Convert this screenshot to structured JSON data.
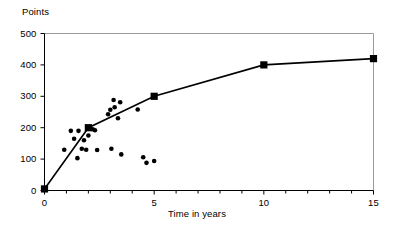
{
  "chart_data": {
    "type": "scatter",
    "title": "",
    "xlabel": "Time in years",
    "ylabel": "Points",
    "xlim": [
      0,
      15
    ],
    "ylim": [
      0,
      500
    ],
    "xticks": [
      0,
      5,
      10,
      15
    ],
    "yticks": [
      0,
      100,
      200,
      300,
      400,
      500
    ],
    "xtick_labels": [
      "0",
      "5",
      "10",
      "15"
    ],
    "ytick_labels": [
      "0",
      "100",
      "200",
      "300",
      "400",
      "500"
    ],
    "x_minor_tick_step": 1,
    "y_minor_tick_step": 100,
    "grid": false,
    "legend": false,
    "legend_position": "none",
    "series": [
      {
        "name": "mean-curve",
        "type": "line",
        "marker": "square",
        "color": "#000000",
        "points": [
          {
            "x": 0,
            "y": 5
          },
          {
            "x": 2,
            "y": 200
          },
          {
            "x": 5,
            "y": 300
          },
          {
            "x": 10,
            "y": 400
          },
          {
            "x": 15,
            "y": 420
          }
        ]
      },
      {
        "name": "observations",
        "type": "scatter",
        "marker": "circle",
        "color": "#000000",
        "points": [
          {
            "x": 0.9,
            "y": 130
          },
          {
            "x": 1.2,
            "y": 190
          },
          {
            "x": 1.35,
            "y": 165
          },
          {
            "x": 1.5,
            "y": 103
          },
          {
            "x": 1.55,
            "y": 190
          },
          {
            "x": 1.7,
            "y": 133
          },
          {
            "x": 1.8,
            "y": 160
          },
          {
            "x": 1.9,
            "y": 130
          },
          {
            "x": 2.0,
            "y": 175
          },
          {
            "x": 2.2,
            "y": 195
          },
          {
            "x": 2.3,
            "y": 192
          },
          {
            "x": 2.4,
            "y": 129
          },
          {
            "x": 2.9,
            "y": 243
          },
          {
            "x": 3.0,
            "y": 257
          },
          {
            "x": 3.05,
            "y": 133
          },
          {
            "x": 3.15,
            "y": 288
          },
          {
            "x": 3.2,
            "y": 265
          },
          {
            "x": 3.35,
            "y": 230
          },
          {
            "x": 3.45,
            "y": 281
          },
          {
            "x": 3.5,
            "y": 115
          },
          {
            "x": 4.25,
            "y": 258
          },
          {
            "x": 4.5,
            "y": 106
          },
          {
            "x": 4.65,
            "y": 88
          },
          {
            "x": 5.0,
            "y": 94
          }
        ]
      }
    ]
  },
  "colors": {
    "ink": "#000000",
    "frame": "#9a9a9a",
    "background": "#ffffff"
  }
}
